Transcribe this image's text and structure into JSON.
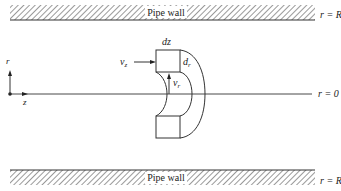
{
  "diagram": {
    "type": "pipe flow differential element",
    "top_wall": {
      "label": "Pipe wall",
      "boundary_label": "r = R"
    },
    "bottom_wall": {
      "label": "Pipe wall",
      "boundary_label": "r = R"
    },
    "centerline": {
      "label": "r = 0"
    },
    "axes": {
      "radial": "r",
      "axial": "z"
    },
    "element": {
      "top_label": "dz",
      "side_label": "d",
      "side_label_sub": "r",
      "axial_velocity": "v",
      "axial_velocity_sub": "z",
      "radial_velocity": "v",
      "radial_velocity_sub": "r"
    },
    "colors": {
      "line": "#333333",
      "hatch": "#555555",
      "background": "#ffffff"
    }
  }
}
